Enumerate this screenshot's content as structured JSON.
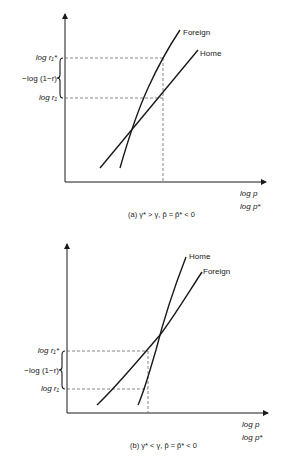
{
  "panel_a": {
    "curve_labels": {
      "foreign": "Foreign",
      "home": "Home"
    },
    "y_labels": {
      "upper": "log r₁*",
      "middle": "−log (1−r)",
      "lower": "log r₁"
    },
    "x_labels": {
      "line1": "log p",
      "line2": "log p*"
    },
    "caption": "(a)  γ* > γ,  p̂ = p̂* < 0"
  },
  "panel_b": {
    "curve_labels": {
      "home": "Home",
      "foreign": "Foreign"
    },
    "y_labels": {
      "upper": "log r₁*",
      "middle": "−log (1−r)",
      "lower": "log r₁"
    },
    "x_labels": {
      "line1": "log p",
      "line2": "log p*"
    },
    "caption": "(b)  γ* < γ,  p̂ = p̂* < 0"
  },
  "colors": {
    "ink": "#1a1a1a",
    "background": "#ffffff"
  }
}
